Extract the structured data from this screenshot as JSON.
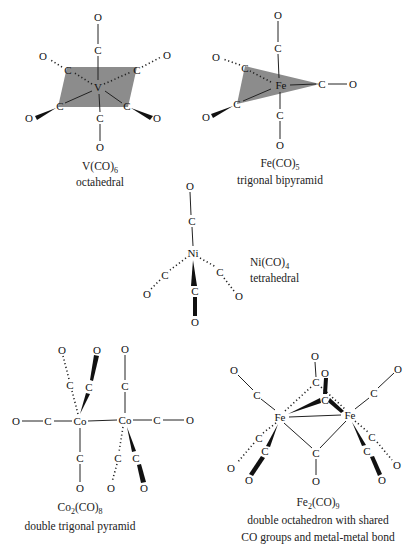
{
  "figure": {
    "structures": [
      {
        "id": "v-co-6",
        "formula": "V(CO)",
        "subscript": "6",
        "geometry": "octahedral",
        "metal": "V",
        "ligand_carbon": "C",
        "ligand_oxygen": "O"
      },
      {
        "id": "fe-co-5",
        "formula": "Fe(CO)",
        "subscript": "5",
        "geometry": "trigonal bipyramid",
        "metal": "Fe",
        "ligand_carbon": "C",
        "ligand_oxygen": "O"
      },
      {
        "id": "ni-co-4",
        "formula": "Ni(CO)",
        "subscript": "4",
        "geometry": "tetrahedral",
        "metal": "Ni",
        "ligand_carbon": "C",
        "ligand_oxygen": "O"
      },
      {
        "id": "co2-co-8",
        "formula_prefix": "Co",
        "formula_prefix_sub": "2",
        "formula": "(CO)",
        "subscript": "8",
        "geometry": "double trigonal pyramid",
        "metal": "Co",
        "ligand_carbon": "C",
        "ligand_oxygen": "O"
      },
      {
        "id": "fe2-co-9",
        "formula_prefix": "Fe",
        "formula_prefix_sub": "2",
        "formula": "(CO)",
        "subscript": "9",
        "geometry_line1": "double octahedron with shared",
        "geometry_line2": "CO groups and metal-metal bond",
        "metal": "Fe",
        "ligand_carbon": "C",
        "ligand_oxygen": "O"
      }
    ],
    "colors": {
      "plane_fill": "#8c8c8c",
      "ink": "#111111",
      "background": "#ffffff"
    }
  }
}
